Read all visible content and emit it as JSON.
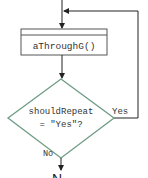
{
  "diagram": {
    "type": "flowchart",
    "colors": {
      "line": "#222222",
      "box_border": "#555555",
      "decision_border": "#6e9c84",
      "text": "#333333",
      "background": "#ffffff"
    },
    "nodes": {
      "process": {
        "label": "aThroughG()"
      },
      "decision": {
        "line1": "shouldRepeat",
        "line2": "= \"Yes\"?"
      }
    },
    "edges": {
      "yes_label": "Yes",
      "no_label": "No"
    },
    "cut_off_bottom_text": "N"
  }
}
